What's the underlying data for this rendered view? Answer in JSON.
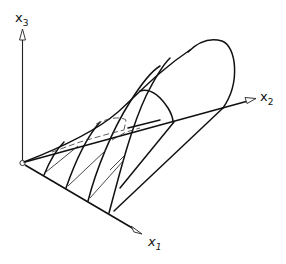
{
  "figure": {
    "axes": {
      "x1": {
        "label": "x",
        "subscript": "1"
      },
      "x2": {
        "label": "x",
        "subscript": "2"
      },
      "x3": {
        "label": "x",
        "subscript": "3"
      }
    },
    "colors": {
      "line": "#111111",
      "background": "#ffffff"
    }
  }
}
